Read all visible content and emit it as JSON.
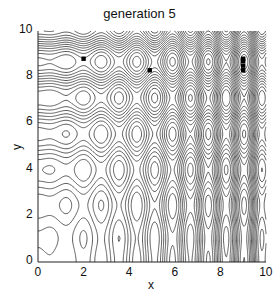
{
  "chart_data": {
    "type": "contour",
    "title": "generation 5",
    "xlabel": "x",
    "ylabel": "y",
    "xlim": [
      0,
      10
    ],
    "ylim": [
      0,
      10
    ],
    "xticks": [
      "0",
      "2",
      "4",
      "6",
      "8",
      "10"
    ],
    "yticks": [
      "0",
      "2",
      "4",
      "6",
      "8",
      "10"
    ],
    "grid": false,
    "function": "x*sin(4x) + 1.1*y*sin(2y)",
    "contour_levels": 20,
    "line_color": "#333333",
    "points": [
      {
        "x": 2.0,
        "y": 8.8
      },
      {
        "x": 4.9,
        "y": 8.3
      },
      {
        "x": 9.0,
        "y": 8.8
      },
      {
        "x": 9.0,
        "y": 8.7
      },
      {
        "x": 9.0,
        "y": 8.5
      },
      {
        "x": 9.0,
        "y": 8.3
      }
    ]
  }
}
